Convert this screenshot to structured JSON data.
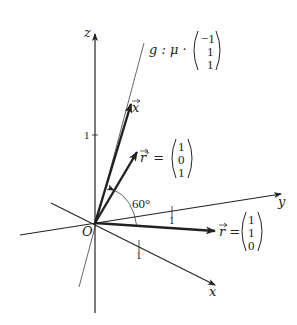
{
  "diagram": {
    "type": "3d-coordinate-system",
    "axes": {
      "x": {
        "label": "x",
        "tick_label": "1"
      },
      "y": {
        "label": "y",
        "tick_label": "1"
      },
      "z": {
        "label": "z",
        "tick_label": "1"
      }
    },
    "origin_label": "O",
    "line_g": {
      "label": "g : μ ·",
      "direction": [
        "−1",
        "1",
        "1"
      ]
    },
    "vectors": [
      {
        "name": "x",
        "label": "x",
        "components": null
      },
      {
        "name": "r_prime",
        "label": "r′ =",
        "components": [
          "1",
          "0",
          "1"
        ]
      },
      {
        "name": "r",
        "label": "r =",
        "components": [
          "1",
          "1",
          "0"
        ]
      }
    ],
    "angle_label": "60°",
    "colors": {
      "stroke": "#222222",
      "background": "#ffffff"
    }
  }
}
